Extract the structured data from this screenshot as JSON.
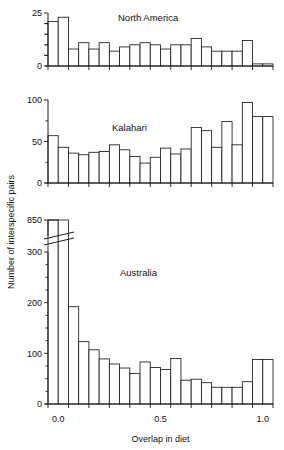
{
  "figure": {
    "ylabel": "Number of interspecific pairs",
    "xlabel": "Overlap in diet",
    "xticklabels": [
      "0.0",
      "0.5",
      "1.0"
    ],
    "xtickvalues": [
      0.0,
      0.5,
      1.0
    ],
    "line_color": "#1a1a1a",
    "bar_fill": "#ffffff"
  },
  "chart_data": [
    {
      "type": "bar",
      "title": "North America",
      "xlabel": "",
      "ylabel": "Number of interspecific pairs",
      "xlim": [
        -0.05,
        1.05
      ],
      "ylim": [
        0,
        25
      ],
      "yticks": [
        0,
        5,
        10,
        15,
        20,
        25
      ],
      "yticklabels": [
        "0",
        "",
        "",
        "",
        "",
        "25"
      ],
      "grid": false,
      "legend": false,
      "bin_width": 0.05,
      "bin_starts": [
        -0.05,
        0.0,
        0.05,
        0.1,
        0.15,
        0.2,
        0.25,
        0.3,
        0.35,
        0.4,
        0.45,
        0.5,
        0.55,
        0.6,
        0.65,
        0.7,
        0.75,
        0.8,
        0.85,
        0.9,
        0.95,
        1.0
      ],
      "categories": [
        "-0.05",
        "0.00",
        "0.05",
        "0.10",
        "0.15",
        "0.20",
        "0.25",
        "0.30",
        "0.35",
        "0.40",
        "0.45",
        "0.50",
        "0.55",
        "0.60",
        "0.65",
        "0.70",
        "0.75",
        "0.80",
        "0.85",
        "0.90",
        "0.95",
        "1.00"
      ],
      "values": [
        21,
        23,
        8,
        11,
        8,
        11,
        7,
        9,
        10,
        11,
        10,
        8,
        10,
        10,
        13,
        9,
        7,
        7,
        7,
        12,
        1,
        1
      ]
    },
    {
      "type": "bar",
      "title": "Kalahari",
      "xlabel": "",
      "ylabel": "Number of interspecific pairs",
      "xlim": [
        -0.05,
        1.05
      ],
      "ylim": [
        0,
        100
      ],
      "yticks": [
        0,
        50,
        100
      ],
      "yticklabels": [
        "0",
        "50",
        "100"
      ],
      "grid": false,
      "legend": false,
      "bin_width": 0.05,
      "bin_starts": [
        -0.05,
        0.0,
        0.05,
        0.1,
        0.15,
        0.2,
        0.25,
        0.3,
        0.35,
        0.4,
        0.45,
        0.5,
        0.55,
        0.6,
        0.65,
        0.7,
        0.75,
        0.8,
        0.85,
        0.9,
        0.95,
        1.0
      ],
      "categories": [
        "-0.05",
        "0.00",
        "0.05",
        "0.10",
        "0.15",
        "0.20",
        "0.25",
        "0.30",
        "0.35",
        "0.40",
        "0.45",
        "0.50",
        "0.55",
        "0.60",
        "0.65",
        "0.70",
        "0.75",
        "0.80",
        "0.85",
        "0.90",
        "0.95",
        "1.00"
      ],
      "values": [
        57,
        43,
        36,
        34,
        37,
        38,
        46,
        40,
        32,
        24,
        31,
        42,
        35,
        41,
        67,
        63,
        43,
        74,
        46,
        97,
        80,
        80
      ]
    },
    {
      "type": "bar",
      "title": "Australia",
      "xlabel": "Overlap in diet",
      "ylabel": "Number of interspecific pairs",
      "xlim": [
        -0.05,
        1.05
      ],
      "ylim": [
        0,
        300
      ],
      "yticks": [
        0,
        100,
        200,
        300
      ],
      "yticklabels": [
        "0",
        "100",
        "200",
        "300"
      ],
      "broken_axis": true,
      "broken_axis_top_label": "850",
      "broken_axis_note": "first bar extends to 850 above the axis break",
      "grid": false,
      "legend": false,
      "bin_width": 0.05,
      "bin_starts": [
        -0.05,
        0.0,
        0.05,
        0.1,
        0.15,
        0.2,
        0.25,
        0.3,
        0.35,
        0.4,
        0.45,
        0.5,
        0.55,
        0.6,
        0.65,
        0.7,
        0.75,
        0.8,
        0.85,
        0.9,
        0.95,
        1.0
      ],
      "categories": [
        "-0.05",
        "0.00",
        "0.05",
        "0.10",
        "0.15",
        "0.20",
        "0.25",
        "0.30",
        "0.35",
        "0.40",
        "0.45",
        "0.50",
        "0.55",
        "0.60",
        "0.65",
        "0.70",
        "0.75",
        "0.80",
        "0.85",
        "0.90",
        "0.95",
        "1.00"
      ],
      "values": [
        850,
        305,
        192,
        123,
        107,
        89,
        79,
        71,
        60,
        83,
        72,
        68,
        90,
        47,
        49,
        42,
        33,
        33,
        33,
        44,
        88,
        88
      ]
    }
  ]
}
